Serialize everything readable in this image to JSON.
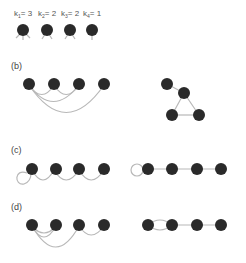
{
  "panel_a": {
    "degree_labels": [
      {
        "k": "k",
        "sub": "1",
        "eq": "= 3"
      },
      {
        "k": "k",
        "sub": "2",
        "eq": "= 2"
      },
      {
        "k": "k",
        "sub": "3",
        "eq": "= 2"
      },
      {
        "k": "k",
        "sub": "4",
        "eq": "= 1"
      }
    ]
  },
  "panel_b": {
    "label": "(b)"
  },
  "panel_c": {
    "label": "(c)"
  },
  "panel_d": {
    "label": "(d)"
  },
  "colors": {
    "node": "#2a2a2a",
    "edge": "#b8b8b8",
    "text": "#444444"
  }
}
